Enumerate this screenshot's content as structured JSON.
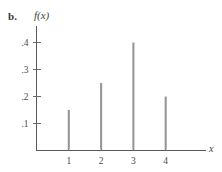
{
  "figure": {
    "part_label": "b.",
    "y_axis_title": "f(x)",
    "x_axis_title": "x"
  },
  "chart_data": {
    "type": "bar",
    "title": "",
    "subtitle": "",
    "xlabel": "x",
    "ylabel": "f(x)",
    "categories": [
      "1",
      "2",
      "3",
      "4"
    ],
    "x": [
      1,
      2,
      3,
      4
    ],
    "values": [
      0.15,
      0.25,
      0.4,
      0.2
    ],
    "series": [
      {
        "name": "f(x)",
        "values": [
          0.15,
          0.25,
          0.4,
          0.2
        ]
      }
    ],
    "ytick_labels": [
      ".1",
      ".2",
      ".3",
      ".4"
    ],
    "ytick_values": [
      0.1,
      0.2,
      0.3,
      0.4
    ],
    "xtick_labels": [
      "1",
      "2",
      "3",
      "4"
    ],
    "xtick_values": [
      1,
      2,
      3,
      4
    ],
    "xlim": [
      0,
      5
    ],
    "ylim": [
      0,
      0.45
    ],
    "grid": false,
    "legend": false,
    "legend_position": "none",
    "style": "stem",
    "annotations": [
      "b."
    ],
    "colors": {
      "stem": "#969696",
      "axis": "#595959",
      "text": "#404040",
      "background": "#ffffff"
    }
  }
}
